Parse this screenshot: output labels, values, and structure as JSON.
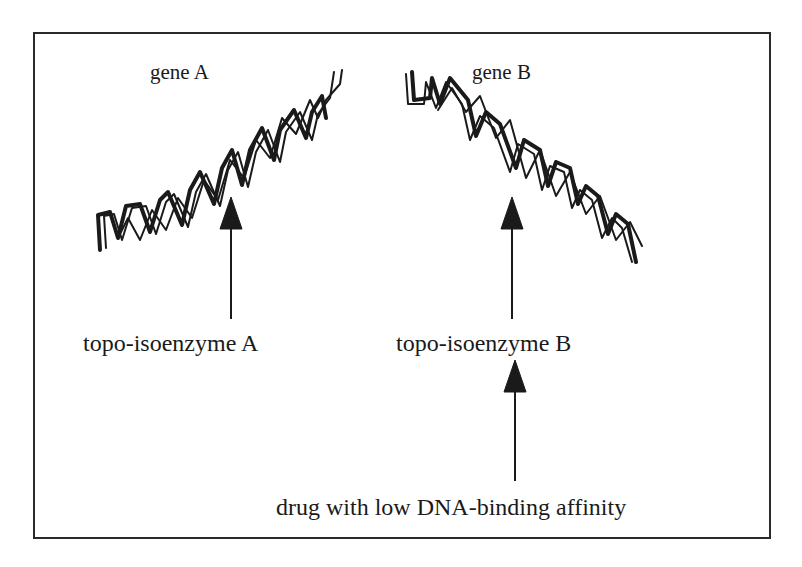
{
  "figure": {
    "gene_a": {
      "label": "gene A"
    },
    "gene_b": {
      "label": "gene B"
    },
    "enzyme_a": {
      "label": "topo-isoenzyme  A"
    },
    "enzyme_b": {
      "label": "topo-isoenzyme  B"
    },
    "drug": {
      "label": "drug with low DNA-binding affinity"
    }
  },
  "colors": {
    "ink": "#1a1a1a",
    "background": "#ffffff",
    "frame": "#2a2a2a"
  }
}
